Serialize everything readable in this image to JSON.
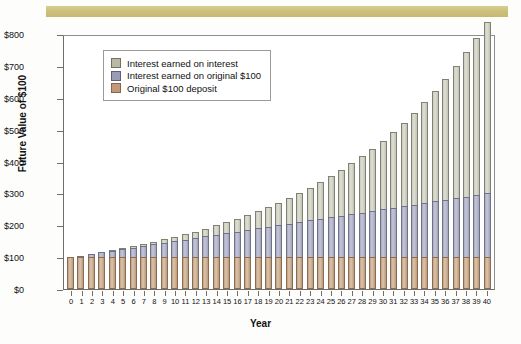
{
  "banner": {
    "name": "top-decorative-band",
    "color": "#cdc07c"
  },
  "chart_data": {
    "type": "bar",
    "stacked": true,
    "title": "",
    "xlabel": "Year",
    "ylabel": "Future Value of $100",
    "ylim": [
      0,
      800
    ],
    "yticks": [
      "$0",
      "$100",
      "$200",
      "$300",
      "$400",
      "$500",
      "$600",
      "$700",
      "$800"
    ],
    "ytick_values": [
      0,
      100,
      200,
      300,
      400,
      500,
      600,
      700,
      800
    ],
    "grid": false,
    "legend_position": "upper left",
    "categories": [
      0,
      1,
      2,
      3,
      4,
      5,
      6,
      7,
      8,
      9,
      10,
      11,
      12,
      13,
      14,
      15,
      16,
      17,
      18,
      19,
      20,
      21,
      22,
      23,
      24,
      25,
      26,
      27,
      28,
      29,
      30,
      31,
      32,
      33,
      34,
      35,
      36,
      37,
      38,
      39,
      40
    ],
    "series": [
      {
        "name": "Original $100 deposit",
        "color": "#c09a78",
        "values": [
          100,
          100,
          100,
          100,
          100,
          100,
          100,
          100,
          100,
          100,
          100,
          100,
          100,
          100,
          100,
          100,
          100,
          100,
          100,
          100,
          100,
          100,
          100,
          100,
          100,
          100,
          100,
          100,
          100,
          100,
          100,
          100,
          100,
          100,
          100,
          100,
          100,
          100,
          100,
          100,
          100
        ]
      },
      {
        "name": "Interest earned on original $100",
        "color": "#9a9cb4",
        "values": [
          0,
          5,
          10,
          15,
          20,
          25,
          30,
          35,
          40,
          45,
          50,
          55,
          60,
          65,
          70,
          75,
          80,
          85,
          90,
          95,
          100,
          105,
          110,
          115,
          120,
          125,
          130,
          135,
          140,
          145,
          150,
          155,
          160,
          165,
          170,
          175,
          180,
          185,
          190,
          195,
          200
        ]
      },
      {
        "name": "Interest earned on interest",
        "color": "#b7b9a6",
        "values": [
          0,
          0,
          0.1,
          0.8,
          1.6,
          2.8,
          4.2,
          6.0,
          8.1,
          10.6,
          13.4,
          16.7,
          20.4,
          24.6,
          29.3,
          34.6,
          40.5,
          47.0,
          54.2,
          62.1,
          70.8,
          80.4,
          90.8,
          102.3,
          114.7,
          128.3,
          143.0,
          159.1,
          176.5,
          195.4,
          215.9,
          238.1,
          262.1,
          288.1,
          316.2,
          346.5,
          379.3,
          414.7,
          452.8,
          494.0,
          538.4
        ]
      }
    ],
    "totals": [
      100,
      105,
      110.1,
      115.8,
      121.6,
      127.8,
      134.2,
      141.0,
      148.1,
      155.6,
      163.4,
      171.7,
      180.4,
      189.6,
      199.3,
      209.6,
      220.5,
      232.0,
      244.2,
      257.1,
      270.8,
      285.4,
      300.8,
      317.3,
      334.7,
      353.3,
      373.0,
      394.1,
      416.5,
      440.4,
      465.9,
      493.1,
      522.1,
      553.1,
      586.2,
      621.5,
      659.3,
      699.7,
      742.8,
      789.0,
      838.4
    ],
    "bar_tops_plot": [
      102,
      107,
      112,
      118,
      124,
      130,
      137,
      144,
      151,
      159,
      167,
      175,
      184,
      193,
      203,
      213,
      224,
      236,
      248,
      261,
      275,
      289,
      305,
      321,
      338,
      356,
      375,
      395,
      416,
      439,
      462,
      487,
      514,
      542,
      572,
      604,
      637,
      672,
      710,
      750,
      790
    ],
    "series_display_values": [
      {
        "year": 0,
        "principal": 100,
        "simple": 0,
        "compound": 0,
        "total": 100
      },
      {
        "year": 10,
        "principal": 100,
        "simple": 50,
        "compound": 13,
        "total": 163
      },
      {
        "year": 20,
        "principal": 100,
        "simple": 100,
        "compound": 71,
        "total": 271
      },
      {
        "year": 30,
        "principal": 100,
        "simple": 150,
        "compound": 216,
        "total": 466
      },
      {
        "year": 40,
        "principal": 100,
        "simple": 200,
        "compound": 430,
        "total": 730
      }
    ]
  },
  "legend": {
    "items": [
      {
        "label": "Interest earned on interest",
        "color": "#b7b9a6"
      },
      {
        "label": "Interest earned on original $100",
        "color": "#9a9cb4"
      },
      {
        "label": "Original $100 deposit",
        "color": "#c09a78"
      }
    ]
  }
}
